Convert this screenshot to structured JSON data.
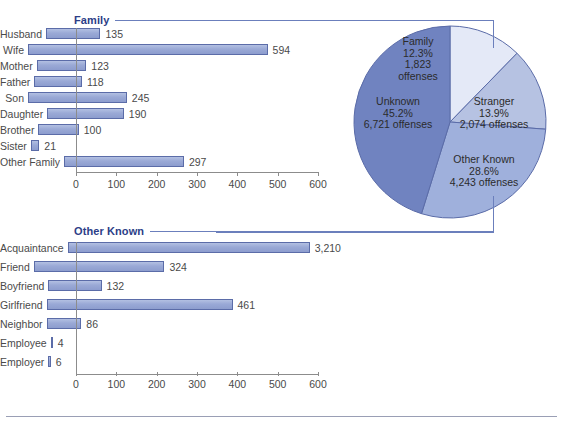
{
  "chart_data": [
    {
      "type": "pie",
      "title": "Offenses by Victim-Offender Relationship",
      "slices": [
        {
          "label": "Family",
          "percent": 12.3,
          "offenses": 1823,
          "percent_text": "12.3%",
          "offenses_text": "1,823",
          "offenses_unit": "offenses",
          "color": "#e4e9f7"
        },
        {
          "label": "Stranger",
          "percent": 13.9,
          "offenses": 2074,
          "percent_text": "13.9%",
          "offenses_text": "2,074 offenses",
          "color": "#b6c2e2"
        },
        {
          "label": "Other Known",
          "percent": 28.6,
          "offenses": 4243,
          "percent_text": "28.6%",
          "offenses_text": "4,243 offenses",
          "color": "#9fb0dc"
        },
        {
          "label": "Unknown",
          "percent": 45.2,
          "offenses": 6721,
          "percent_text": "45.2%",
          "offenses_text": "6,721 offenses",
          "color": "#7083c0"
        }
      ],
      "legend_position": "inside",
      "grid": false
    },
    {
      "type": "bar",
      "orientation": "horizontal",
      "title": "Family",
      "categories": [
        "Husband",
        "Wife",
        "Mother",
        "Father",
        "Son",
        "Daughter",
        "Brother",
        "Sister",
        "Other Family"
      ],
      "values": [
        135,
        594,
        123,
        118,
        245,
        190,
        100,
        21,
        297
      ],
      "value_labels": [
        "135",
        "594",
        "123",
        "118",
        "245",
        "190",
        "100",
        "21",
        "297"
      ],
      "xlabel": "",
      "ylabel": "",
      "xlim": [
        0,
        600
      ],
      "xticks": [
        0,
        100,
        200,
        300,
        400,
        500,
        600
      ],
      "xtick_labels": [
        "0",
        "100",
        "200",
        "300",
        "400",
        "500",
        "600"
      ],
      "grid": false
    },
    {
      "type": "bar",
      "orientation": "horizontal",
      "title": "Other Known",
      "categories": [
        "Acquaintance",
        "Friend",
        "Boyfriend",
        "Girlfriend",
        "Neighbor",
        "Employee",
        "Employer"
      ],
      "values": [
        3210,
        324,
        132,
        461,
        86,
        4,
        6
      ],
      "value_labels": [
        "3,210",
        "324",
        "132",
        "461",
        "86",
        "4",
        "6"
      ],
      "clipped_categories": [
        "Acquaintance"
      ],
      "xlabel": "",
      "ylabel": "",
      "xlim": [
        0,
        600
      ],
      "xticks": [
        0,
        100,
        200,
        300,
        400,
        500,
        600
      ],
      "xtick_labels": [
        "0",
        "100",
        "200",
        "300",
        "400",
        "500",
        "600"
      ],
      "grid": false
    }
  ],
  "sections": {
    "family": {
      "title": "Family"
    },
    "other_known": {
      "title": "Other Known"
    }
  },
  "colors": {
    "accent": "#2c3e87",
    "rule": "#6b7fbc",
    "bar_fill": "#9aa9d6",
    "bar_stroke": "#5b6ca8",
    "slice_family": "#e4e9f7",
    "slice_stranger": "#b6c2e2",
    "slice_other_known": "#9fb0dc",
    "slice_unknown": "#7083c0",
    "axis": "#8c8c8c",
    "text": "#4a4a4a"
  }
}
